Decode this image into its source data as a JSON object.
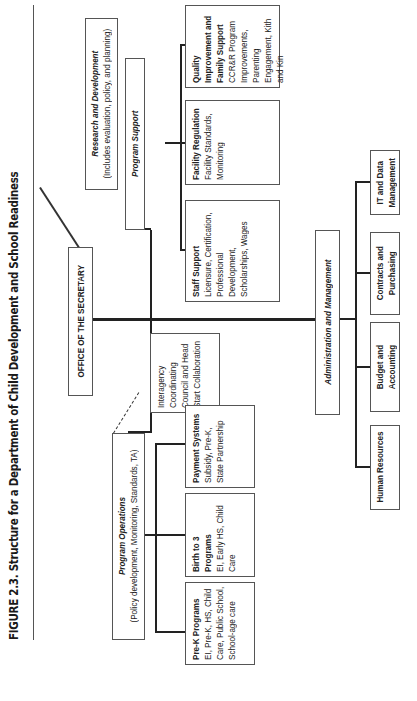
{
  "figure": {
    "title": "FIGURE 2.3. Structure for a Department of Child Development and School Readiness"
  },
  "secretary": {
    "label": "OFFICE OF THE SECRETARY"
  },
  "research": {
    "title": "Research and Development",
    "subtitle": "(Includes evaluation, policy, and planning)"
  },
  "program_support": {
    "title": "Program Support",
    "children": [
      {
        "title": "Staff Support",
        "body": "Licensure, Certification, Professional Development, Scholarships, Wages"
      },
      {
        "title": "Facility Regulation",
        "body": "Facility Standards, Monitoring"
      },
      {
        "title": "Quality Improvement and Family Support",
        "body": "CCR&R Program Improvements, Parenting Engagement, Kith and Kin"
      }
    ]
  },
  "program_operations": {
    "title": "Program Operations",
    "subtitle": "(Policy development, Monitoring, Standards, TA)",
    "children": [
      {
        "title": "Pre-K Programs",
        "body": "EI, Pre-K, HS, Child Care, Public School, School-age care"
      },
      {
        "title": "Birth to 3 Programs",
        "body": "EI, Early HS, Child Care"
      },
      {
        "title": "Payment Systems",
        "body": "Subsidy, Pre-K, State Partnership"
      }
    ]
  },
  "interagency": {
    "label": "Interagency Coordinating Council and Head Start Collaboration"
  },
  "administration": {
    "title": "Administration and Management",
    "children": [
      {
        "label": "Human Resources"
      },
      {
        "label": "Budget and Accounting"
      },
      {
        "label": "Contracts and Purchasing"
      },
      {
        "label": "IT and Data Management"
      }
    ]
  }
}
